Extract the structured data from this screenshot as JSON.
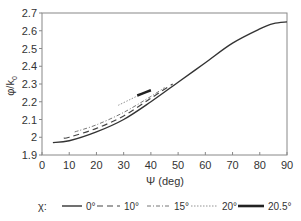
{
  "chart_data": {
    "type": "line",
    "title": "",
    "xlabel": "Ψ (deg)",
    "ylabel": "φ/k₀",
    "xlim": [
      0,
      90
    ],
    "ylim": [
      1.9,
      2.7
    ],
    "xticks": [
      0,
      10,
      20,
      30,
      40,
      50,
      60,
      70,
      80,
      90
    ],
    "yticks": [
      1.9,
      2,
      2.1,
      2.2,
      2.3,
      2.4,
      2.5,
      2.6,
      2.7
    ],
    "ytick_labels": [
      "1.9",
      "2",
      "2.1",
      "2.2",
      "2.3",
      "2.4",
      "2.5",
      "2.6",
      "2.7"
    ],
    "grid": false,
    "legend_position": "bottom",
    "legend_title": "χ:",
    "series": [
      {
        "name": "0°",
        "style": "solid",
        "x": [
          4,
          10,
          20,
          30,
          40,
          50,
          60,
          70,
          80,
          85,
          90
        ],
        "y": [
          1.97,
          1.98,
          2.03,
          2.1,
          2.2,
          2.31,
          2.42,
          2.53,
          2.61,
          2.64,
          2.65
        ]
      },
      {
        "name": "10°",
        "style": "dashed",
        "x": [
          8,
          10,
          20,
          30,
          40,
          48
        ],
        "y": [
          1.995,
          2.0,
          2.05,
          2.12,
          2.22,
          2.3
        ]
      },
      {
        "name": "15°",
        "style": "dash-dot",
        "x": [
          12,
          20,
          30,
          40,
          45
        ],
        "y": [
          2.03,
          2.07,
          2.14,
          2.23,
          2.28
        ]
      },
      {
        "name": "20°",
        "style": "dotted",
        "x": [
          28,
          32,
          36,
          40
        ],
        "y": [
          2.18,
          2.21,
          2.24,
          2.27
        ]
      },
      {
        "name": "20.5°",
        "style": "thick-solid",
        "x": [
          35,
          37.5,
          40
        ],
        "y": [
          2.235,
          2.25,
          2.265
        ]
      }
    ]
  },
  "axes": {
    "x_label": "Ψ (deg)",
    "y_label_main": "φ/k",
    "y_label_sub": "0"
  },
  "legend": {
    "title": "χ:",
    "items": [
      "0°",
      "10°",
      "15°",
      "20°",
      "20.5°"
    ]
  },
  "colors": {
    "line": "#333333",
    "axis": "#888888"
  }
}
